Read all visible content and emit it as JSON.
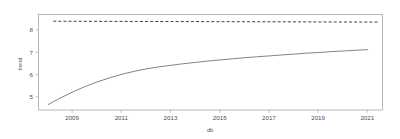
{
  "chart_data": {
    "type": "line",
    "title": "",
    "xlabel": "db",
    "ylabel": "trend",
    "xlim": [
      2007.6,
      2021.6
    ],
    "ylim": [
      4.45,
      8.72
    ],
    "grid": false,
    "legend": "none",
    "xticks": [
      "2009",
      "2011",
      "2013",
      "2015",
      "2017",
      "2019",
      "2021"
    ],
    "xtick_values": [
      2009,
      2011,
      2013,
      2015,
      2017,
      2019,
      2021
    ],
    "yticks": [
      "5",
      "6",
      "7",
      "8"
    ],
    "ytick_values": [
      5,
      6,
      7,
      8
    ],
    "series": [
      {
        "name": "trend",
        "style": "solid",
        "color": "#6b6b6b",
        "x": [
          2008.0,
          2008.5,
          2009.0,
          2009.5,
          2010.0,
          2010.5,
          2011.0,
          2011.5,
          2012.0,
          2012.5,
          2013.0,
          2013.5,
          2014.0,
          2014.5,
          2015.0,
          2015.5,
          2016.0,
          2016.5,
          2017.0,
          2017.5,
          2018.0,
          2018.5,
          2019.0,
          2019.5,
          2020.0,
          2020.5,
          2021.0
        ],
        "values": [
          4.7,
          4.99,
          5.26,
          5.5,
          5.71,
          5.89,
          6.05,
          6.18,
          6.29,
          6.38,
          6.45,
          6.52,
          6.58,
          6.64,
          6.69,
          6.74,
          6.79,
          6.83,
          6.87,
          6.91,
          6.95,
          6.99,
          7.02,
          7.06,
          7.09,
          7.12,
          7.15
        ]
      },
      {
        "name": "reference",
        "style": "dashed",
        "color": "#2b2b2b",
        "x": [
          2008.2,
          2021.4
        ],
        "values": [
          8.42,
          8.38
        ]
      }
    ],
    "annotations": []
  },
  "figure": {
    "background_color": "#ffffff",
    "frame_color": "#9a9a9a",
    "text_color": "#4d4d4d"
  }
}
